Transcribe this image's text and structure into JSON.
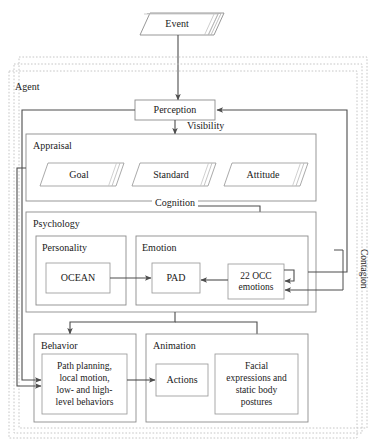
{
  "diagram": {
    "colors": {
      "stroke": "#4d4d4d",
      "stroke_light": "#8c8c8c",
      "dashed": "#b3b3b3",
      "text": "#1a1a1a",
      "background": "#ffffff"
    },
    "nodes": {
      "event": "Event",
      "agent": "Agent",
      "perception": "Perception",
      "appraisal": "Appraisal",
      "goal": "Goal",
      "standard": "Standard",
      "attitude": "Attitude",
      "psychology": "Psychology",
      "personality": "Personality",
      "ocean": "OCEAN",
      "emotion": "Emotion",
      "pad": "PAD",
      "occ": "22 OCC emotions",
      "occ_line1": "22 OCC",
      "occ_line2": "emotions",
      "behavior": "Behavior",
      "behavior_detail": "Path planning, local motion, low- and high-level behaviors",
      "behavior_line1": "Path planning,",
      "behavior_line2": "local motion,",
      "behavior_line3": "low- and high-",
      "behavior_line4": "level behaviors",
      "animation": "Animation",
      "actions": "Actions",
      "facial": "Facial expressions and static body postures",
      "facial_line1": "Facial",
      "facial_line2": "expressions and",
      "facial_line3": "static body",
      "facial_line4": "postures"
    },
    "edge_labels": {
      "visibility": "Visibility",
      "cognition": "Cognition",
      "contagion": "Contagion"
    }
  }
}
